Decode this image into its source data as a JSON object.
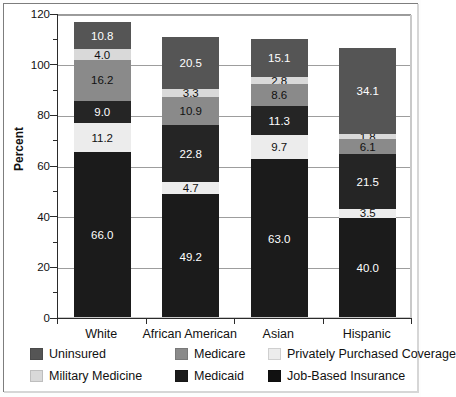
{
  "chart_data": {
    "type": "bar",
    "stacked": true,
    "title": "",
    "xlabel": "",
    "ylabel": "Percent",
    "ylim": [
      0,
      120
    ],
    "ytick_step": 20,
    "yticks": [
      "0",
      "20",
      "40",
      "60",
      "80",
      "100",
      "120"
    ],
    "grid": "horizontal",
    "legend_position": "bottom",
    "categories": [
      "White",
      "African American",
      "Asian",
      "Hispanic"
    ],
    "series": [
      {
        "name": "Job-Based Insurance",
        "color": "#1b1b1b",
        "values": [
          66.0,
          49.2,
          63.0,
          40.0
        ]
      },
      {
        "name": "Privately Purchased Coverage",
        "color": "#ececec",
        "values": [
          11.2,
          4.7,
          9.7,
          3.5
        ]
      },
      {
        "name": "Medicaid",
        "color": "#252525",
        "values": [
          9.0,
          22.8,
          11.3,
          21.5
        ]
      },
      {
        "name": "Medicare",
        "color": "#8a8a8a",
        "values": [
          16.2,
          10.9,
          8.6,
          6.1
        ]
      },
      {
        "name": "Military Medicine",
        "color": "#d9d9d9",
        "values": [
          4.0,
          3.3,
          2.8,
          1.8
        ]
      },
      {
        "name": "Uninsured",
        "color": "#555555",
        "values": [
          10.8,
          20.5,
          15.1,
          34.1
        ]
      }
    ],
    "totals": [
      117.2,
      111.4,
      110.5,
      107.0
    ],
    "value_labels": {
      "White": {
        "Job-Based Insurance": "66.0",
        "Privately Purchased Coverage": "11.2",
        "Medicaid": "9.0",
        "Medicare": "16.2",
        "Military Medicine": "4.0",
        "Uninsured": "10.8"
      },
      "African American": {
        "Job-Based Insurance": "49.2",
        "Privately Purchased Coverage": "4.7",
        "Medicaid": "22.8",
        "Medicare": "10.9",
        "Military Medicine": "3.3",
        "Uninsured": "20.5"
      },
      "Asian": {
        "Job-Based Insurance": "63.0",
        "Privately Purchased Coverage": "9.7",
        "Medicaid": "11.3",
        "Medicare": "8.6",
        "Military Medicine": "2.8",
        "Uninsured": "15.1"
      },
      "Hispanic": {
        "Job-Based Insurance": "40.0",
        "Privately Purchased Coverage": "3.5",
        "Medicaid": "21.5",
        "Medicare": "6.1",
        "Military Medicine": "1.8",
        "Uninsured": "34.1"
      }
    }
  },
  "axis": {
    "y_title": "Percent",
    "y_ticks": [
      "120",
      "100",
      "80",
      "60",
      "40",
      "20",
      "0"
    ],
    "x_ticks": [
      "White",
      "African American",
      "Asian",
      "Hispanic"
    ]
  },
  "legend": {
    "items": [
      {
        "label": "Uninsured",
        "color": "#555555"
      },
      {
        "label": "Medicare",
        "color": "#8a8a8a"
      },
      {
        "label": "Privately Purchased Coverage",
        "color": "#ececec"
      },
      {
        "label": "Military Medicine",
        "color": "#d9d9d9"
      },
      {
        "label": "Medicaid",
        "color": "#1b1b1b"
      },
      {
        "label": "Job-Based Insurance",
        "color": "#111111"
      }
    ]
  },
  "colors": {
    "plot_background": "#ffffff",
    "grid": "#9d9d9d",
    "axis": "#2b2b2b",
    "frame": "#9a9a9a"
  }
}
